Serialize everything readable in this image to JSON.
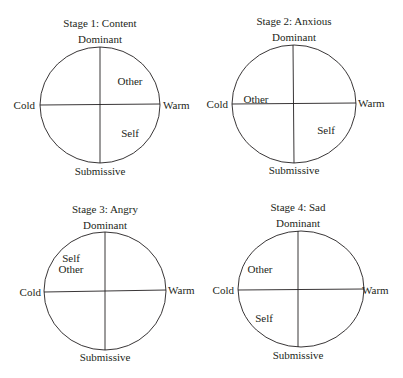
{
  "axes": {
    "top": "Dominant",
    "bottom": "Submissive",
    "left": "Cold",
    "right": "Warm"
  },
  "stages": [
    {
      "title": "Stage 1: Content",
      "markers": [
        {
          "label": "Other",
          "quadrant": "upper-right"
        },
        {
          "label": "Self",
          "quadrant": "lower-right"
        }
      ]
    },
    {
      "title": "Stage 2: Anxious",
      "markers": [
        {
          "label": "Other",
          "quadrant": "on-left-axis"
        },
        {
          "label": "Self",
          "quadrant": "lower-right"
        }
      ]
    },
    {
      "title": "Stage 3: Angry",
      "markers": [
        {
          "label": "Self",
          "quadrant": "upper-left"
        },
        {
          "label": "Other",
          "quadrant": "upper-left"
        }
      ]
    },
    {
      "title": "Stage 4: Sad",
      "markers": [
        {
          "label": "Other",
          "quadrant": "upper-left"
        },
        {
          "label": "Self",
          "quadrant": "lower-left"
        }
      ]
    }
  ]
}
